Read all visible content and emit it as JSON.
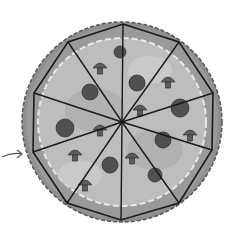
{
  "image": {
    "subject": "pizza divided into 10 slices",
    "slice_count": 10,
    "center": [
      122,
      122
    ],
    "vertices": [
      [
        123,
        24
      ],
      [
        179,
        42
      ],
      [
        213,
        93
      ],
      [
        212,
        150
      ],
      [
        179,
        203
      ],
      [
        121,
        220
      ],
      [
        67,
        203
      ],
      [
        33,
        152
      ],
      [
        34,
        93
      ],
      [
        68,
        42
      ]
    ],
    "colors": {
      "background": "#ffffff",
      "crust": "#8a8a8a",
      "crust_edge": "#5a5a5a",
      "sauce": "#a8a8a8",
      "cheese": "#c8c8c8",
      "topping": "#505050",
      "cut_line": "#1a1a1a"
    },
    "toppings": [
      {
        "type": "pepperoni",
        "cx": 90,
        "cy": 92,
        "r": 8
      },
      {
        "type": "pepperoni",
        "cx": 65,
        "cy": 128,
        "r": 9
      },
      {
        "type": "pepperoni",
        "cx": 137,
        "cy": 83,
        "r": 8
      },
      {
        "type": "pepperoni",
        "cx": 180,
        "cy": 108,
        "r": 9
      },
      {
        "type": "pepperoni",
        "cx": 163,
        "cy": 140,
        "r": 8
      },
      {
        "type": "pepperoni",
        "cx": 110,
        "cy": 165,
        "r": 8
      },
      {
        "type": "pepperoni",
        "cx": 155,
        "cy": 175,
        "r": 7
      },
      {
        "type": "pepperoni",
        "cx": 120,
        "cy": 52,
        "r": 6
      },
      {
        "type": "mushroom",
        "cx": 100,
        "cy": 68
      },
      {
        "type": "mushroom",
        "cx": 168,
        "cy": 82
      },
      {
        "type": "mushroom",
        "cx": 75,
        "cy": 155
      },
      {
        "type": "mushroom",
        "cx": 140,
        "cy": 110
      },
      {
        "type": "mushroom",
        "cx": 100,
        "cy": 130
      },
      {
        "type": "mushroom",
        "cx": 190,
        "cy": 135
      },
      {
        "type": "mushroom",
        "cx": 132,
        "cy": 158
      },
      {
        "type": "mushroom",
        "cx": 85,
        "cy": 185
      }
    ],
    "arrow": {
      "from": [
        2,
        156
      ],
      "to": [
        22,
        153
      ]
    }
  }
}
